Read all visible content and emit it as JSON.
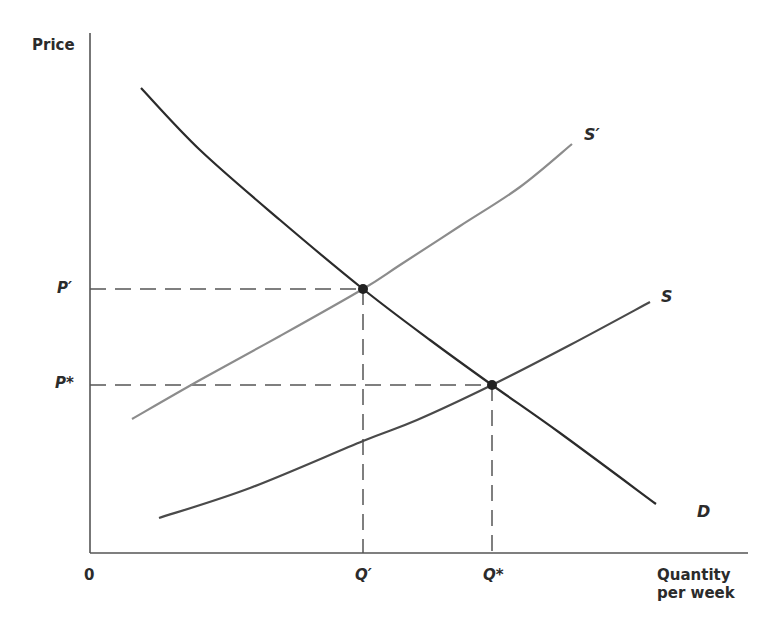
{
  "chart_data": {
    "type": "line",
    "title": "",
    "xlabel": "Quantity per week",
    "ylabel": "Price",
    "grid": false,
    "legend": "none (curves labeled directly)",
    "x_ticks": [
      {
        "label": "0",
        "role": "origin"
      },
      {
        "label": "Q′",
        "role": "new equilibrium quantity"
      },
      {
        "label": "Q*",
        "role": "original equilibrium quantity"
      }
    ],
    "y_ticks": [
      {
        "label": "P′",
        "role": "new equilibrium price"
      },
      {
        "label": "P*",
        "role": "original equilibrium price"
      }
    ],
    "series": [
      {
        "name": "D",
        "description": "Demand curve, downward sloping",
        "color": "#2b2b2b",
        "points_px": [
          [
            141,
            88
          ],
          [
            200,
            150
          ],
          [
            280,
            220
          ],
          [
            363,
            289
          ],
          [
            430,
            340
          ],
          [
            492,
            385
          ],
          [
            560,
            433
          ],
          [
            656,
            504
          ]
        ]
      },
      {
        "name": "S",
        "description": "Original supply curve, upward sloping",
        "color": "#4a4a4a",
        "points_px": [
          [
            159,
            518
          ],
          [
            250,
            488
          ],
          [
            363,
            441
          ],
          [
            417,
            420
          ],
          [
            492,
            385
          ],
          [
            570,
            345
          ],
          [
            650,
            302
          ]
        ]
      },
      {
        "name": "S′",
        "description": "Shifted supply curve (leftward/upward)",
        "color": "#8c8c8c",
        "points_px": [
          [
            132,
            419
          ],
          [
            200,
            380
          ],
          [
            280,
            336
          ],
          [
            363,
            289
          ],
          [
            400,
            265
          ],
          [
            460,
            226
          ],
          [
            520,
            187
          ],
          [
            572,
            144
          ]
        ]
      }
    ],
    "points": [
      {
        "name": "E′",
        "x_label": "Q′",
        "y_label": "P′",
        "px": [
          363,
          289
        ]
      },
      {
        "name": "E*",
        "x_label": "Q*",
        "y_label": "P*",
        "px": [
          492,
          385
        ]
      }
    ],
    "axes_px": {
      "origin": [
        90,
        553
      ],
      "y_top": 33,
      "x_right": 748
    }
  },
  "labels": {
    "y_axis": "Price",
    "x_axis_line1": "Quantity",
    "x_axis_line2": "per week",
    "origin": "0",
    "p_prime": "P′",
    "p_star": "P*",
    "q_prime": "Q′",
    "q_star": "Q*",
    "curve_d": "D",
    "curve_s": "S",
    "curve_s_prime": "S′"
  }
}
